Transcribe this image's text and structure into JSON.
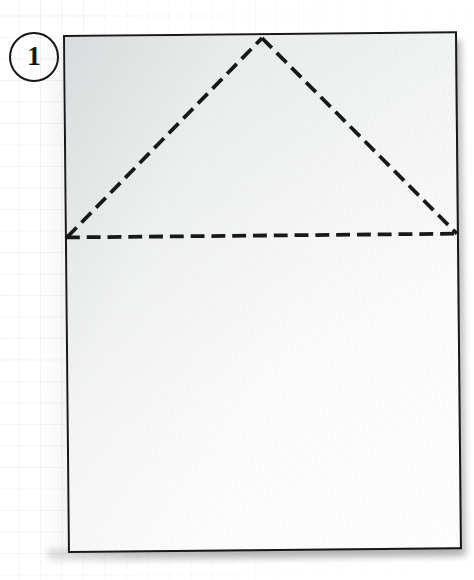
{
  "illustration": {
    "title": "Origami fold diagram - step 1",
    "step_badge": {
      "number": "1",
      "shape": "circle-outline"
    },
    "paper": {
      "name": "square-sheet-of-paper",
      "face_color": "#f5f6f6",
      "shade_color": "#d3d6d8",
      "outline_color": "#17181a",
      "rotation_degrees": -0.55,
      "corners": {
        "top_left": [
          63,
          35
        ],
        "top_right": [
          457,
          31
        ],
        "bottom_right": [
          453,
          550
        ],
        "bottom_left": [
          61,
          553
        ]
      }
    },
    "fold_lines": [
      {
        "name": "horizontal-valley-fold",
        "style": "dashed",
        "color": "#17181a",
        "from": [
          0,
          202
        ],
        "to": [
          394,
          202
        ]
      },
      {
        "name": "left-diagonal-fold",
        "style": "dashed",
        "color": "#17181a",
        "from": [
          0,
          202
        ],
        "to": [
          199,
          3
        ]
      },
      {
        "name": "right-diagonal-fold",
        "style": "dashed",
        "color": "#17181a",
        "from": [
          199,
          3
        ],
        "to": [
          394,
          202
        ]
      }
    ],
    "dash": {
      "length": "14",
      "gap": "7",
      "width": "3.6"
    },
    "background": {
      "name": "graph-paper-grid",
      "grid_spacing_px": "21.5",
      "grid_color": "#96a5b4",
      "page_color": "#ffffff"
    }
  }
}
